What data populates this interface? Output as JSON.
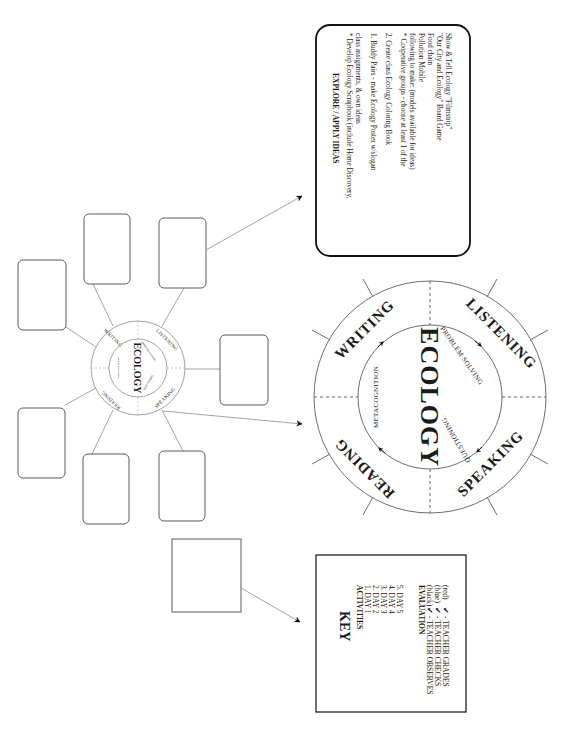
{
  "diagram": {
    "orientation": "rotated 90 degrees clockwise",
    "small_wheel": {
      "center": "ECOLOGY",
      "ring": [
        "WRITING",
        "LISTENING",
        "SPEAKING",
        "READING"
      ],
      "inner": [
        "METACOGNITION",
        "PROBLEM SOLVING",
        "QUESTIONING"
      ]
    },
    "big_wheel": {
      "center": "ECOLOGY",
      "ring": {
        "writing": "WRITING",
        "listening": "LISTENING",
        "speaking": "SPEAKING",
        "reading": "READING"
      },
      "inner": {
        "metacognition": "METACOGNITION",
        "problem_solving": "PROBLEM SOLVING",
        "questioning": "QUESTIONING"
      }
    },
    "explore_box": {
      "title": "EXPLORE / APPLY IDEAS",
      "lines": [
        "*  Develop Ecology Scrapbook (include Home Discovery,",
        "    class assignments, & own ideas",
        "",
        "1. Buddy Pairs - make Ecology Poster w/slogan",
        "",
        "2. Create class Ecology Coloring Book",
        "",
        "*  Cooperative groups - choose at least 1 of the",
        "    following to make: (models available for ideas)",
        "      Pollution Mobile",
        "      Food chain",
        "      \"Our City and Ecology\" Board Game",
        "      Show & Tell Ecology \"Filmstrip\""
      ]
    },
    "key_box": {
      "title": "KEY",
      "activities_heading": "ACTIVITIES",
      "activities": [
        "1. DAY 1",
        "2. DAY 2",
        "3. DAY 3",
        "4. DAY 4",
        "5. DAY 5"
      ],
      "evaluation_heading": "EVALUATION",
      "evaluation": [
        {
          "color_label": "(black)",
          "mark": "✔",
          "text": "- TEACHER OBSERVES"
        },
        {
          "color_label": "(blue)",
          "mark": "✔",
          "text": "- TEACHER CHECKS"
        },
        {
          "color_label": "(red)",
          "mark": "✔",
          "text": "- TEACHER GRADES"
        }
      ]
    },
    "blank_boxes_count": 7,
    "colors": {
      "line": "#9a9a9a",
      "ink": "#1a1a1a",
      "background": "#ffffff"
    }
  }
}
